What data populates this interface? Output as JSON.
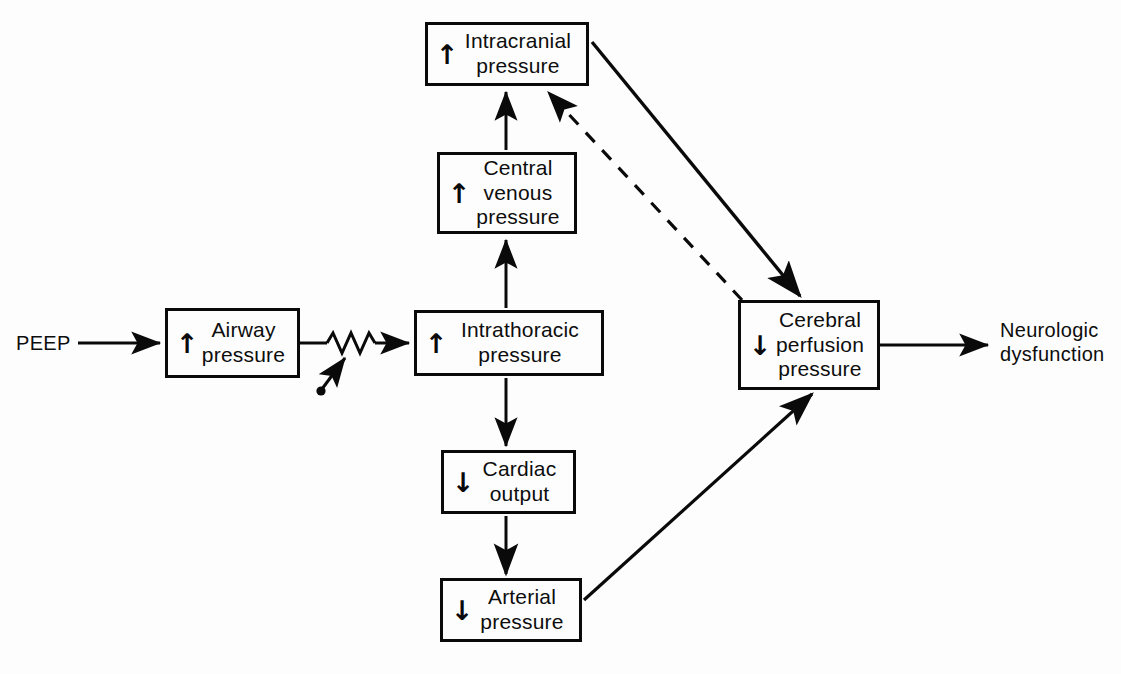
{
  "diagram": {
    "background_color": "#fdfdfd",
    "line_color": "#0a0a0a",
    "text_color": "#0d0d0d",
    "nodes": [
      {
        "id": "intracranial-pressure",
        "direction": "↑",
        "direction_name": "up-arrow",
        "label": "Intracranial\npressure",
        "x": 425,
        "y": 22,
        "w": 164,
        "h": 64
      },
      {
        "id": "central-venous-pressure",
        "direction": "↑",
        "direction_name": "up-arrow",
        "label": "Central\nvenous\npressure",
        "x": 437,
        "y": 152,
        "w": 140,
        "h": 82
      },
      {
        "id": "intrathoracic-pressure",
        "direction": "↑",
        "direction_name": "up-arrow",
        "label": "Intrathoracic\npressure",
        "x": 414,
        "y": 310,
        "w": 190,
        "h": 66
      },
      {
        "id": "cardiac-output",
        "direction": "↓",
        "direction_name": "down-arrow",
        "label": "Cardiac\noutput",
        "x": 441,
        "y": 450,
        "w": 135,
        "h": 64
      },
      {
        "id": "arterial-pressure",
        "direction": "↓",
        "direction_name": "down-arrow",
        "label": "Arterial\npressure",
        "x": 440,
        "y": 578,
        "w": 142,
        "h": 64
      },
      {
        "id": "airway-pressure",
        "direction": "↑",
        "direction_name": "up-arrow",
        "label": "Airway\npressure",
        "x": 165,
        "y": 308,
        "w": 135,
        "h": 70
      },
      {
        "id": "cerebral-perfusion-pressure",
        "direction": "↓",
        "direction_name": "down-arrow",
        "label": "Cerebral\nperfusion\npressure",
        "x": 738,
        "y": 300,
        "w": 142,
        "h": 90
      }
    ],
    "free_labels": [
      {
        "id": "peep-input",
        "text": "PEEP",
        "x": 16,
        "y": 328
      },
      {
        "id": "neurologic-dysfunction-output",
        "text": "Neurologic\ndysfunction",
        "x": 1000,
        "y": 318
      }
    ],
    "connectors": [
      {
        "id": "peep-to-airway",
        "from": "PEEP",
        "to": "Airway pressure",
        "style": "solid",
        "arrow": "end"
      },
      {
        "id": "airway-to-intrathoracic",
        "from": "Airway pressure",
        "to": "Intrathoracic pressure",
        "style": "solid-resistor",
        "arrow": "end",
        "symbol": "variable-resistor"
      },
      {
        "id": "intrathoracic-to-central-venous",
        "from": "Intrathoracic pressure",
        "to": "Central venous pressure",
        "style": "solid",
        "arrow": "end"
      },
      {
        "id": "central-venous-to-intracranial",
        "from": "Central venous pressure",
        "to": "Intracranial pressure",
        "style": "solid",
        "arrow": "end"
      },
      {
        "id": "intrathoracic-to-cardiac-output",
        "from": "Intrathoracic pressure",
        "to": "Cardiac output",
        "style": "solid",
        "arrow": "end"
      },
      {
        "id": "cardiac-output-to-arterial",
        "from": "Cardiac output",
        "to": "Arterial pressure",
        "style": "solid",
        "arrow": "end"
      },
      {
        "id": "intracranial-to-cerebral-perfusion",
        "from": "Intracranial pressure",
        "to": "Cerebral perfusion pressure",
        "style": "solid",
        "arrow": "end"
      },
      {
        "id": "cerebral-perfusion-to-intracranial",
        "from": "Cerebral perfusion pressure",
        "to": "Intracranial pressure",
        "style": "dashed",
        "arrow": "end"
      },
      {
        "id": "arterial-to-cerebral-perfusion",
        "from": "Arterial pressure",
        "to": "Cerebral perfusion pressure",
        "style": "solid",
        "arrow": "end"
      },
      {
        "id": "cerebral-perfusion-to-neurologic",
        "from": "Cerebral perfusion pressure",
        "to": "Neurologic dysfunction",
        "style": "solid",
        "arrow": "end"
      }
    ]
  }
}
